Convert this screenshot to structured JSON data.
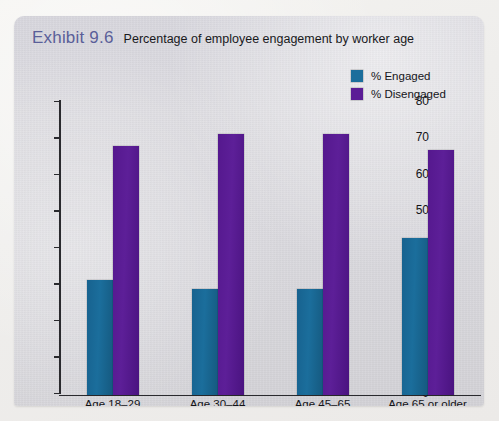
{
  "exhibit": {
    "number": "Exhibit 9.6",
    "title": "Percentage of employee engagement by worker age",
    "number_color": "#5a5f99"
  },
  "legend": {
    "items": [
      {
        "label": "% Engaged",
        "color": "#1b6e9c",
        "icon": "square-swatch-icon"
      },
      {
        "label": "% Disengaged",
        "color": "#5b1d96",
        "icon": "square-swatch-icon"
      }
    ]
  },
  "chart_data": {
    "type": "bar",
    "title": "Percentage of employee engagement by worker age",
    "xlabel": "",
    "ylabel": "",
    "ylim": [
      0,
      80
    ],
    "yticks": [
      0,
      10,
      20,
      30,
      40,
      50,
      60,
      70,
      80
    ],
    "grid": false,
    "legend_position": "top-right",
    "categories": [
      "Age 18–29",
      "Age 30–44",
      "Age 45–65",
      "Age 65 or older"
    ],
    "series": [
      {
        "name": "% Engaged",
        "color": "#1b6e9c",
        "values": [
          31.5,
          29,
          29,
          43
        ]
      },
      {
        "name": "% Disengaged",
        "color": "#5b1d96",
        "values": [
          68,
          71.5,
          71.5,
          67
        ]
      }
    ]
  }
}
